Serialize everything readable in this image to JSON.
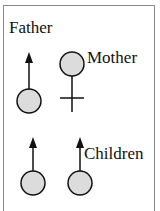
{
  "diagram": {
    "labels": {
      "father": "Father",
      "mother": "Mother",
      "children": "Children"
    },
    "nodes": [
      {
        "id": "father",
        "symbol": "male",
        "role": "parent"
      },
      {
        "id": "mother",
        "symbol": "female",
        "role": "parent"
      },
      {
        "id": "child-1",
        "symbol": "male",
        "role": "child"
      },
      {
        "id": "child-2",
        "symbol": "male",
        "role": "child"
      }
    ],
    "colors": {
      "circle_fill": "#dcdcdc",
      "stroke": "#111111",
      "frame": "#8a8a8a"
    }
  }
}
